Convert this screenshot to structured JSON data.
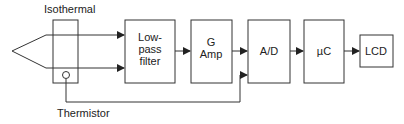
{
  "diagram": {
    "labels": {
      "isothermal": "Isothermal",
      "thermistor": "Thermistor"
    },
    "blocks": [
      {
        "id": "lowpass",
        "lines": [
          "Low-",
          "pass",
          "filter"
        ]
      },
      {
        "id": "gamp",
        "lines": [
          "G",
          "Amp"
        ]
      },
      {
        "id": "ad",
        "lines": [
          "A/D"
        ]
      },
      {
        "id": "uc",
        "lines": [
          "µC"
        ]
      },
      {
        "id": "lcd",
        "lines": [
          "LCD"
        ]
      }
    ],
    "colors": {
      "stroke": "#333333",
      "text": "#222222",
      "background": "#ffffff"
    }
  }
}
